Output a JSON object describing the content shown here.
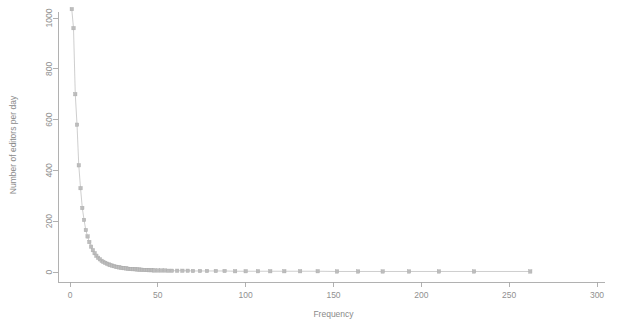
{
  "chart_data": {
    "type": "scatter",
    "title": "",
    "subtitle": "",
    "xlabel": "Frequency",
    "ylabel": "Number of editors per day",
    "xlim": [
      0,
      300
    ],
    "ylim": [
      0,
      1040
    ],
    "grid": false,
    "legend": null,
    "marker": "square",
    "marker_color": "#bdbdbd",
    "line_color": "#c2c2c2",
    "axis_color": "#a8a8a8",
    "background": "#ffffff",
    "xticks": [
      0,
      50,
      100,
      150,
      200,
      250,
      300
    ],
    "xticklabels": [
      "0",
      "50",
      "100",
      "150",
      "200",
      "250",
      "300"
    ],
    "yticks": [
      0,
      200,
      400,
      600,
      800,
      1000
    ],
    "yticklabels": [
      "0",
      "200",
      "400",
      "600",
      "800",
      "1000"
    ],
    "series": [
      {
        "name": "editors per day",
        "x": [
          1,
          2,
          3,
          4,
          5,
          6,
          7,
          8,
          9,
          10,
          11,
          12,
          13,
          14,
          15,
          16,
          17,
          18,
          19,
          20,
          21,
          22,
          23,
          24,
          25,
          26,
          27,
          28,
          29,
          30,
          31,
          32,
          33,
          34,
          35,
          36,
          37,
          38,
          39,
          40,
          41,
          42,
          43,
          44,
          45,
          46,
          47,
          48,
          50,
          52,
          54,
          56,
          58,
          61,
          64,
          67,
          70,
          74,
          78,
          83,
          88,
          94,
          100,
          107,
          114,
          122,
          131,
          141,
          152,
          164,
          178,
          193,
          210,
          230,
          262
        ],
        "y": [
          1035,
          960,
          700,
          580,
          420,
          330,
          252,
          205,
          165,
          140,
          118,
          100,
          86,
          74,
          64,
          56,
          50,
          44,
          40,
          36,
          33,
          30,
          27,
          25,
          23,
          21,
          20,
          18,
          17,
          16,
          15,
          14,
          13,
          12,
          12,
          11,
          11,
          10,
          10,
          9,
          9,
          8,
          8,
          8,
          7,
          7,
          7,
          6,
          6,
          6,
          6,
          5,
          5,
          5,
          5,
          5,
          4,
          4,
          4,
          4,
          4,
          3,
          3,
          3,
          3,
          3,
          3,
          3,
          2,
          2,
          2,
          2,
          2,
          2,
          2
        ]
      }
    ]
  }
}
